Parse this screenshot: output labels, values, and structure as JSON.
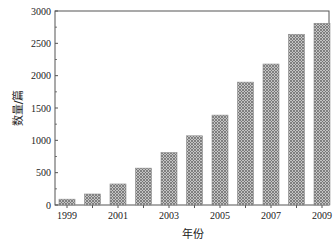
{
  "chart_data": {
    "type": "bar",
    "title": "",
    "xlabel": "年份",
    "ylabel": "数量/篇",
    "categories": [
      "1999",
      "2000",
      "2001",
      "2002",
      "2003",
      "2004",
      "2005",
      "2006",
      "2007",
      "2008",
      "2009"
    ],
    "values": [
      90,
      170,
      325,
      570,
      810,
      1070,
      1390,
      1900,
      2180,
      2640,
      2810
    ],
    "ylim": [
      0,
      3000
    ],
    "yticks": [
      0,
      500,
      1000,
      1500,
      2000,
      2500,
      3000
    ],
    "xtick_labels": [
      "1999",
      "2001",
      "2003",
      "2005",
      "2007",
      "2009"
    ],
    "grid": false,
    "legend": null,
    "bar_fill": "crosshatch-gray",
    "colors": {
      "bar": "#a8a8a8",
      "bar_hatch": "#6e6e6e",
      "axis": "#555555"
    }
  }
}
